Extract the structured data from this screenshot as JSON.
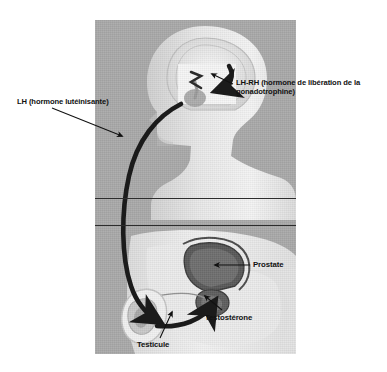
{
  "figure": {
    "background_color": "#ffffff",
    "panel_color": "#a9a9a9",
    "ink_color": "#111111"
  },
  "labels": {
    "lhrh": "LH-RH (hormone de libération de la gonadotrophine)",
    "lh": "LH (hormone lutéinisante)",
    "prostate": "Prostate",
    "testosterone": "Testostérone",
    "testicule": "Testicule"
  },
  "anatomy": {
    "head": "head-silhouette",
    "brain": "brain-outline",
    "pituitary": "pituitary-gland",
    "torso": "torso-silhouette",
    "pelvis": "pelvis-silhouette",
    "bladder": "bladder-shape",
    "prostate_gland": "prostate-shape",
    "testis": "testis-shape"
  },
  "arrows": {
    "lh_pathway": "lh-curve-arrow",
    "lhrh_release": "lhrh-arrow",
    "testosterone_feedback": "testosterone-curve-arrow",
    "leader_lh": "lh-leader-line",
    "leader_lhrh": "lhrh-leader-line",
    "leader_prostate": "prostate-leader-line",
    "leader_testosterone": "testosterone-leader-line",
    "leader_testicule": "testicule-leader-line"
  },
  "dividers": {
    "upper_rule_y": 178,
    "lower_rule_y": 205
  }
}
